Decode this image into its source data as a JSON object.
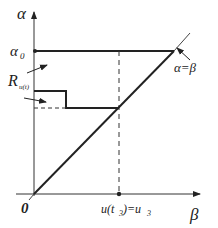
{
  "axes": {
    "y_label": "α",
    "x_label": "β",
    "origin_label": "0"
  },
  "labels": {
    "alpha0": "α",
    "alpha0_sub": "0",
    "region": "R",
    "region_sub": "u(t)",
    "diagonal": "α=β",
    "u_main": "u(t",
    "u_sub1": "3",
    "u_mid": ")=u",
    "u_sub2": "3"
  },
  "colors": {
    "line": "#222222",
    "thin": "#555555"
  }
}
